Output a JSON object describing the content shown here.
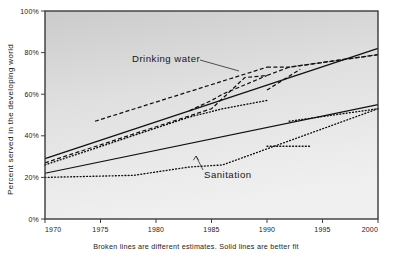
{
  "chart_data": {
    "type": "line",
    "title": "",
    "xlabel": "",
    "ylabel": "Percent served in the developing world",
    "caption": "Broken lines are different estimates. Solid lines are better fit",
    "xlim": [
      1970,
      2000
    ],
    "ylim": [
      0,
      100
    ],
    "grid": false,
    "legend": "annotations",
    "x_ticks": [
      "1970",
      "1975",
      "1980",
      "1985",
      "1990",
      "1995",
      "2000"
    ],
    "x_tick_values": [
      1970,
      1975,
      1980,
      1985,
      1990,
      1995,
      2000
    ],
    "y_ticks": [
      "0%",
      "20%",
      "40%",
      "60%",
      "80%",
      "100%"
    ],
    "y_tick_values": [
      0,
      20,
      40,
      60,
      80,
      100
    ],
    "annotations": [
      {
        "name": "drinking-water",
        "label": "Drinking  water",
        "text_x": 132,
        "text_y": 62,
        "leader": [
          [
            200,
            60
          ],
          [
            239,
            71
          ]
        ]
      },
      {
        "name": "sanitation",
        "label": "Sanitation",
        "text_x": 204,
        "text_y": 178,
        "leader": [
          [
            203,
            170
          ],
          [
            196,
            156
          ]
        ]
      }
    ],
    "series": [
      {
        "name": "Drinking water - best fit",
        "style": "solid",
        "group": "drinking-water",
        "points": [
          [
            1970,
            29
          ],
          [
            2000,
            82
          ]
        ]
      },
      {
        "name": "Drinking water - estimate A",
        "style": "dashed",
        "group": "drinking-water",
        "points": [
          [
            1970,
            27
          ],
          [
            1985,
            53
          ],
          [
            1988,
            68
          ],
          [
            1990,
            69
          ],
          [
            1992,
            73
          ],
          [
            2000,
            79
          ]
        ]
      },
      {
        "name": "Drinking water - estimate B",
        "style": "dashed",
        "group": "drinking-water",
        "points": [
          [
            1974.5,
            47
          ],
          [
            1990,
            73
          ]
        ]
      },
      {
        "name": "Drinking water - estimate C",
        "style": "dashed",
        "group": "drinking-water",
        "points": [
          [
            1983,
            52
          ],
          [
            1985,
            57
          ],
          [
            1986,
            60
          ],
          [
            1990,
            69
          ]
        ]
      },
      {
        "name": "Drinking water - estimate D",
        "style": "dashed",
        "group": "drinking-water",
        "points": [
          [
            1990,
            62
          ],
          [
            1993,
            72
          ]
        ]
      },
      {
        "name": "Drinking water - estimate E",
        "style": "dashed",
        "group": "drinking-water",
        "points": [
          [
            1990,
            73
          ],
          [
            1992,
            73
          ],
          [
            2000,
            79
          ]
        ]
      },
      {
        "name": "Drinking water - dotted estimate",
        "style": "dotted",
        "group": "drinking-water",
        "points": [
          [
            1970,
            26
          ],
          [
            1983,
            49
          ],
          [
            1986,
            53
          ],
          [
            1990,
            57
          ]
        ]
      },
      {
        "name": "Sanitation - best fit",
        "style": "solid",
        "group": "sanitation",
        "points": [
          [
            1970,
            22
          ],
          [
            2000,
            55
          ]
        ]
      },
      {
        "name": "Sanitation - dotted estimate",
        "style": "dotted",
        "group": "sanitation",
        "points": [
          [
            1970,
            20
          ],
          [
            1978,
            21
          ],
          [
            1983,
            25
          ],
          [
            1986,
            26
          ],
          [
            2000,
            53
          ]
        ]
      },
      {
        "name": "Sanitation - dotted segment late",
        "style": "dotted",
        "group": "sanitation",
        "points": [
          [
            1990,
            35
          ],
          [
            1994,
            35
          ]
        ]
      },
      {
        "name": "Sanitation - dotted segment right",
        "style": "dotted",
        "group": "sanitation",
        "points": [
          [
            1992,
            47
          ],
          [
            2000,
            53
          ]
        ]
      }
    ]
  },
  "figure": {
    "bg_top": "#cfcfcf",
    "bg_bottom": "#efefef",
    "frame_color": "#3a3a3a",
    "ink": "#111111"
  }
}
